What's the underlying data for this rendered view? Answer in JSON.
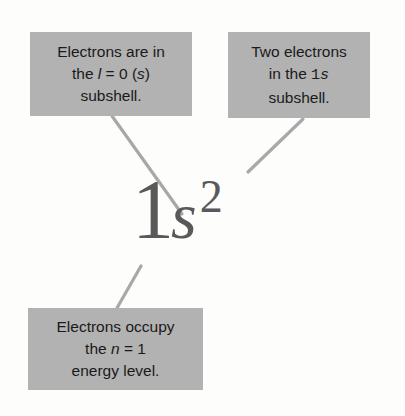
{
  "figure": {
    "name": "electron-configuration-notation-diagram",
    "background_color": "#fdfdfb",
    "callout_fill_color": "#b2b2b2",
    "callout_text_color": "#1a1a1a",
    "notation_color": "#595959",
    "connector_color": "#a8a8a8"
  },
  "notation": {
    "full": "1s2",
    "principal_quantum_number": "1",
    "subshell_letter": "s",
    "electron_count": "2"
  },
  "callouts": [
    {
      "id": "subshell-l",
      "lines": [
        {
          "text": "Electrons are in"
        },
        {
          "prefix": "the ",
          "var1": "l",
          "mid": " = 0 (",
          "var2": "s",
          "suffix": ")"
        },
        {
          "text": "subshell."
        }
      ],
      "plain_text": "Electrons are in the l = 0 (s) subshell."
    },
    {
      "id": "two-electrons",
      "lines": [
        {
          "text": "Two electrons"
        },
        {
          "prefix": "in the ",
          "term_number": "1",
          "term_var": "s",
          "suffix": ""
        },
        {
          "text": "subshell."
        }
      ],
      "plain_text": "Two electrons in the 1s subshell."
    },
    {
      "id": "energy-level",
      "lines": [
        {
          "text": "Electrons occupy"
        },
        {
          "prefix": "the ",
          "var1": "n",
          "mid": " = 1",
          "suffix": ""
        },
        {
          "text": "energy level."
        }
      ],
      "plain_text": "Electrons occupy the n = 1 energy level."
    }
  ],
  "connectors": [
    {
      "id": "connector-subshell-l-to-s",
      "from": [
        112,
        116
      ],
      "to": [
        182,
        214
      ]
    },
    {
      "id": "connector-two-electrons-to-exponent",
      "from": [
        303,
        119
      ],
      "to": [
        248,
        172
      ]
    },
    {
      "id": "connector-energy-level-to-one",
      "from": [
        141,
        266
      ],
      "to": [
        117,
        308
      ]
    }
  ]
}
